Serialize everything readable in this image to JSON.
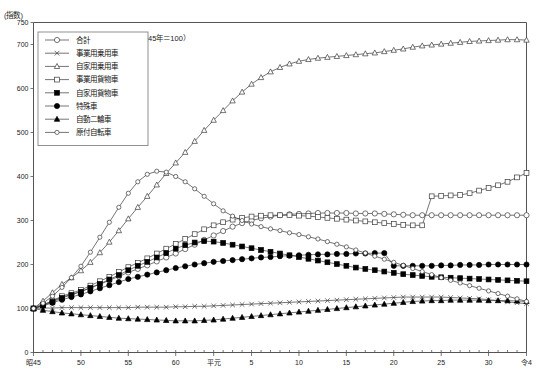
{
  "axis": {
    "y_unit_label": "(指数)",
    "y_ticks": [
      "0",
      "100",
      "200",
      "300",
      "400",
      "500",
      "600",
      "700",
      "750"
    ],
    "y_tick_values": [
      0,
      100,
      200,
      300,
      400,
      500,
      600,
      700,
      750
    ],
    "x_tick_labels": [
      "昭45",
      "50",
      "55",
      "60",
      "平元",
      "5",
      "10",
      "15",
      "20",
      "25",
      "30",
      "令4"
    ],
    "x_tick_values": [
      1970,
      1975,
      1980,
      1985,
      1989,
      1993,
      1998,
      2003,
      2008,
      2013,
      2018,
      2022
    ]
  },
  "annotation": "（昭和45年＝100）",
  "legend": {
    "items": [
      {
        "label": "合計",
        "marker": "circle-open"
      },
      {
        "label": "事業用乗用車",
        "marker": "x-cross"
      },
      {
        "label": "自家用乗用車",
        "marker": "triangle-open"
      },
      {
        "label": "事業用貨物車",
        "marker": "square-open"
      },
      {
        "label": "自家用貨物車",
        "marker": "square-filled"
      },
      {
        "label": "特殊車",
        "marker": "circle-filled"
      },
      {
        "label": "自動二輪車",
        "marker": "triangle-filled"
      },
      {
        "label": "原付自転車",
        "marker": "circle-small-open"
      }
    ]
  },
  "chart_data": {
    "type": "line",
    "title": "",
    "xlabel": "",
    "ylabel": "(指数)",
    "ylim": [
      0,
      750
    ],
    "xlim": [
      1970,
      2022
    ],
    "grid": false,
    "legend_position": "top-left",
    "note": "（昭和45年＝100）",
    "x": [
      1970,
      1971,
      1972,
      1973,
      1974,
      1975,
      1976,
      1977,
      1978,
      1979,
      1980,
      1981,
      1982,
      1983,
      1984,
      1985,
      1986,
      1987,
      1988,
      1989,
      1990,
      1991,
      1992,
      1993,
      1994,
      1995,
      1996,
      1997,
      1998,
      1999,
      2000,
      2001,
      2002,
      2003,
      2004,
      2005,
      2006,
      2007,
      2008,
      2009,
      2010,
      2011,
      2012,
      2013,
      2014,
      2015,
      2016,
      2017,
      2018,
      2019,
      2020,
      2021,
      2022
    ],
    "series": [
      {
        "name": "合計",
        "marker": "circle-open",
        "values": [
          100,
          108,
          117,
          126,
          132,
          139,
          147,
          155,
          164,
          173,
          182,
          190,
          198,
          207,
          216,
          225,
          235,
          245,
          256,
          266,
          276,
          286,
          294,
          300,
          305,
          309,
          312,
          314,
          315,
          316,
          317,
          317,
          317,
          317,
          316,
          316,
          316,
          315,
          314,
          313,
          312,
          312,
          312,
          312,
          312,
          312,
          312,
          312,
          312,
          312,
          312,
          312,
          312
        ]
      },
      {
        "name": "事業用乗用車",
        "marker": "x-cross",
        "values": [
          100,
          101,
          101,
          102,
          102,
          102,
          102,
          102,
          102,
          102,
          102,
          103,
          103,
          103,
          103,
          104,
          104,
          105,
          105,
          106,
          107,
          108,
          109,
          110,
          111,
          112,
          113,
          114,
          115,
          116,
          117,
          118,
          119,
          120,
          121,
          122,
          123,
          124,
          125,
          126,
          126,
          126,
          126,
          126,
          125,
          124,
          123,
          122,
          120,
          118,
          115,
          113,
          111
        ]
      },
      {
        "name": "自家用乗用車",
        "marker": "triangle-open",
        "values": [
          100,
          117,
          136,
          155,
          170,
          186,
          205,
          227,
          251,
          277,
          304,
          330,
          355,
          381,
          407,
          431,
          455,
          480,
          505,
          528,
          550,
          572,
          592,
          610,
          625,
          638,
          648,
          656,
          662,
          666,
          669,
          671,
          673,
          675,
          677,
          679,
          681,
          684,
          687,
          690,
          694,
          697,
          699,
          701,
          703,
          705,
          707,
          708,
          709,
          710,
          711,
          711,
          710
        ]
      },
      {
        "name": "事業用貨物車",
        "marker": "square-open",
        "values": [
          100,
          108,
          118,
          128,
          135,
          142,
          152,
          162,
          172,
          183,
          194,
          204,
          214,
          225,
          236,
          247,
          258,
          269,
          280,
          289,
          296,
          302,
          306,
          309,
          311,
          312,
          312,
          312,
          311,
          310,
          308,
          306,
          304,
          302,
          300,
          298,
          296,
          294,
          292,
          290,
          289,
          289,
          355,
          356,
          357,
          358,
          362,
          368,
          374,
          380,
          388,
          398,
          408
        ]
      },
      {
        "name": "自家用貨物車",
        "marker": "square-filled",
        "values": [
          100,
          107,
          115,
          124,
          131,
          138,
          147,
          156,
          166,
          176,
          187,
          197,
          206,
          216,
          226,
          236,
          244,
          250,
          253,
          252,
          249,
          245,
          241,
          237,
          233,
          229,
          225,
          221,
          217,
          213,
          209,
          205,
          201,
          197,
          193,
          190,
          187,
          184,
          181,
          178,
          176,
          174,
          172,
          171,
          170,
          169,
          168,
          167,
          166,
          165,
          164,
          163,
          162
        ]
      },
      {
        "name": "特殊車",
        "marker": "circle-filled",
        "values": [
          100,
          106,
          113,
          120,
          126,
          132,
          139,
          146,
          153,
          160,
          167,
          172,
          177,
          182,
          187,
          192,
          196,
          200,
          203,
          206,
          208,
          210,
          212,
          214,
          216,
          217,
          219,
          220,
          221,
          222,
          223,
          223,
          224,
          224,
          225,
          225,
          226,
          226,
          197,
          197,
          197,
          197,
          197,
          198,
          198,
          199,
          199,
          199,
          200,
          200,
          200,
          200,
          200
        ]
      },
      {
        "name": "自動二輪車",
        "marker": "triangle-filled",
        "values": [
          100,
          96,
          93,
          90,
          88,
          86,
          84,
          82,
          80,
          78,
          77,
          76,
          75,
          74,
          73,
          72,
          72,
          72,
          73,
          74,
          76,
          78,
          80,
          82,
          84,
          86,
          88,
          90,
          92,
          94,
          96,
          98,
          100,
          102,
          104,
          106,
          108,
          110,
          112,
          114,
          116,
          117,
          118,
          118,
          119,
          119,
          119,
          119,
          118,
          118,
          118,
          117,
          116
        ]
      },
      {
        "name": "原付自転車",
        "marker": "circle-small-open",
        "values": [
          100,
          112,
          128,
          148,
          170,
          196,
          228,
          262,
          296,
          330,
          362,
          388,
          405,
          412,
          410,
          400,
          388,
          372,
          355,
          338,
          322,
          310,
          300,
          292,
          286,
          281,
          277,
          272,
          268,
          263,
          258,
          252,
          246,
          240,
          233,
          226,
          219,
          212,
          205,
          198,
          191,
          184,
          177,
          170,
          164,
          158,
          152,
          146,
          140,
          134,
          128,
          122,
          116
        ]
      }
    ]
  }
}
